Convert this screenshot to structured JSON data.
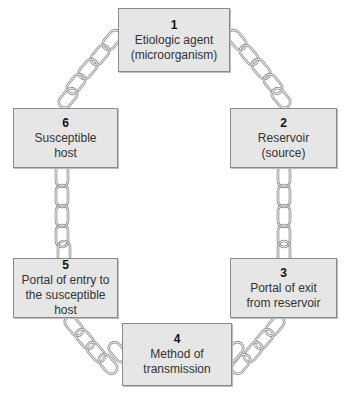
{
  "diagram": {
    "type": "chain-of-infection",
    "links": [
      {
        "number": "1",
        "label": "Etiologic agent\n(microorganism)"
      },
      {
        "number": "2",
        "label": "Reservoir\n(source)"
      },
      {
        "number": "3",
        "label": "Portal of exit\nfrom reservoir"
      },
      {
        "number": "4",
        "label": "Method of\ntransmission"
      },
      {
        "number": "5",
        "label": "Portal of entry to\nthe susceptible host"
      },
      {
        "number": "6",
        "label": "Susceptible\nhost"
      }
    ],
    "connections": [
      [
        "1",
        "2"
      ],
      [
        "2",
        "3"
      ],
      [
        "3",
        "4"
      ],
      [
        "4",
        "5"
      ],
      [
        "5",
        "6"
      ],
      [
        "6",
        "1"
      ]
    ],
    "colors": {
      "box_fill": "#e6e6e6",
      "box_border": "#8a8a8a",
      "chain": "#8c8c8c"
    }
  }
}
